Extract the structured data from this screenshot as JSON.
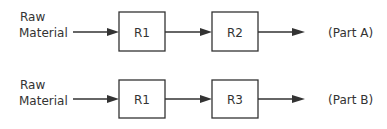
{
  "diagram": {
    "rows": [
      {
        "input_label_line1": "Raw",
        "input_label_line2": "Material",
        "stages": [
          "R1",
          "R2"
        ],
        "output_label": "(Part A)"
      },
      {
        "input_label_line1": "Raw",
        "input_label_line2": "Material",
        "stages": [
          "R1",
          "R3"
        ],
        "output_label": "(Part B)"
      }
    ],
    "colors": {
      "stroke": "#333333",
      "text": "#333333",
      "background": "#ffffff"
    }
  }
}
